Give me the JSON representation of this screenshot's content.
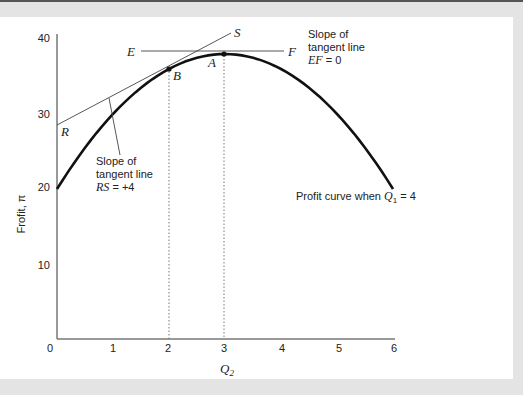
{
  "chart_data": {
    "type": "line",
    "title": "",
    "xlabel": "Q2",
    "ylabel": "Frofit, π",
    "xlim": [
      0,
      6
    ],
    "ylim": [
      0,
      40
    ],
    "x_ticks": [
      "0",
      "1",
      "2",
      "3",
      "4",
      "5",
      "6"
    ],
    "y_ticks": [
      "10",
      "20",
      "30",
      "40"
    ],
    "grid": false,
    "series": [
      {
        "name": "Profit curve when Q1 = 4",
        "x": [
          0,
          1,
          2,
          3,
          4,
          5,
          6
        ],
        "values": [
          20,
          30,
          36,
          38,
          36,
          30,
          20
        ]
      },
      {
        "name": "Tangent line RS",
        "x": [
          0,
          3.1
        ],
        "values": [
          28,
          40.4
        ]
      },
      {
        "name": "Tangent line EF",
        "x": [
          1.5,
          4.05
        ],
        "values": [
          38,
          38
        ]
      }
    ],
    "points": [
      {
        "label": "A",
        "x": 3,
        "y": 38
      },
      {
        "label": "B",
        "x": 2,
        "y": 36
      },
      {
        "label": "R",
        "x": 0,
        "y": 28
      },
      {
        "label": "S",
        "x": 3.1,
        "y": 40.4
      },
      {
        "label": "E",
        "x": 1.5,
        "y": 38
      },
      {
        "label": "F",
        "x": 4.05,
        "y": 38
      }
    ],
    "annotations": [
      {
        "text": "Slope of tangent line RS = +4"
      },
      {
        "text": "Slope of tangent line EF = 0"
      },
      {
        "text": "Profit curve when Q1 = 4"
      }
    ]
  },
  "labels": {
    "ylabel": "Frofit, π",
    "xlabel_main": "Q",
    "xlabel_sub": "2",
    "x_ticks": [
      "0",
      "1",
      "2",
      "3",
      "4",
      "5",
      "6"
    ],
    "y_ticks": [
      "10",
      "20",
      "30",
      "40"
    ],
    "A": "A",
    "B": "B",
    "R": "R",
    "S": "S",
    "E": "E",
    "F": "F",
    "rs_note": {
      "line1": "Slope of",
      "line2": "tangent line",
      "line3_var": "RS",
      "line3_val": " = +4"
    },
    "ef_note": {
      "line1": "Slope of",
      "line2": "tangent line",
      "line3_var": "EF",
      "line3_val": " = 0"
    },
    "curve_note": {
      "text": "Profit curve when ",
      "var": "Q",
      "sub": "1",
      "val": " = 4"
    }
  }
}
